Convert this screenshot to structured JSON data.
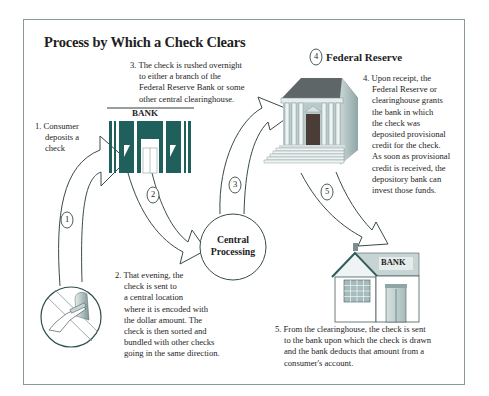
{
  "diagram": {
    "title": "Process by Which a Check Clears",
    "colors": {
      "frame": "#8a9a9c",
      "bank_teal": "#1f5f5c",
      "outline": "#2f4f4f",
      "fed_roof": "#5f6668",
      "fed_wall": "#a9bcbc"
    },
    "steps": [
      {
        "number": "1",
        "lines": [
          "1. Consumer",
          "deposits a",
          "check"
        ]
      },
      {
        "number": "2",
        "lines": [
          "2. That evening, the",
          "check is sent to",
          "a central location",
          "where it is encoded with",
          "the dollar amount. The",
          "check is then sorted and",
          "bundled with other checks",
          "going in the same direction."
        ]
      },
      {
        "number": "3",
        "lines": [
          "3. The check is rushed overnight",
          "to either a branch of the",
          "Federal Reserve Bank or some",
          "other central clearinghouse."
        ]
      },
      {
        "number": "4",
        "lines": [
          "4. Upon receipt, the",
          "Federal Reserve or",
          "clearinghouse grants",
          "the bank in which",
          "the check was",
          "deposited provisional",
          "credit for the check.",
          "As soon as provisional",
          "credit is received, the",
          "depository bank can",
          "invest those funds."
        ]
      },
      {
        "number": "5",
        "lines": [
          "5. From the clearinghouse, the check is sent",
          "to the bank upon which the check is drawn",
          "and the bank deducts that amount from a",
          "consumer's account."
        ]
      }
    ],
    "nodes": {
      "federal_reserve": {
        "badge": "4",
        "label": "Federal Reserve",
        "icon": "federal-reserve-building-icon"
      },
      "central_processing": {
        "lines": [
          "Central",
          "Processing"
        ]
      },
      "depositing_bank": {
        "label": "BANK",
        "icon": "bank-storefront-icon"
      },
      "drawee_bank": {
        "label": "BANK",
        "icon": "bank-house-icon"
      },
      "consumer": {
        "icon": "atm-deposit-hand-icon"
      }
    },
    "arrow_badges": [
      "1",
      "2",
      "3",
      "5"
    ]
  }
}
